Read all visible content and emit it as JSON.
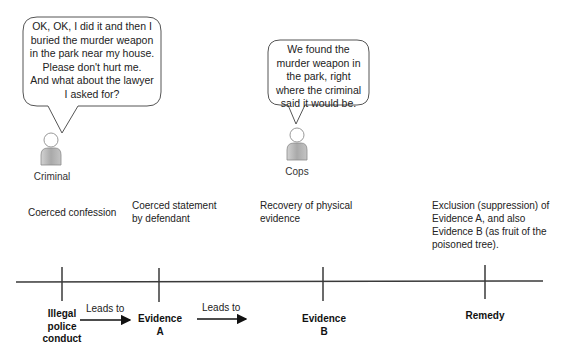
{
  "speech_bubbles": [
    {
      "speaker": "Criminal",
      "lines": [
        "OK, OK, I did it and then I",
        "buried the murder weapon",
        "in the park near my house.",
        "Please don't hurt me.",
        "And what about the lawyer",
        "I asked for?"
      ]
    },
    {
      "speaker": "Cops",
      "lines": [
        "We found the",
        "murder weapon in",
        "the park, right",
        "where the criminal",
        "said it would be."
      ]
    }
  ],
  "persons": [
    {
      "label": "Criminal",
      "icon": "person-icon"
    },
    {
      "label": "Cops",
      "icon": "person-icon"
    }
  ],
  "step_descriptions": [
    {
      "lines": [
        "Coerced confession"
      ]
    },
    {
      "lines": [
        "Coerced statement",
        "by defendant"
      ]
    },
    {
      "lines": [
        "Recovery of physical",
        "evidence"
      ]
    },
    {
      "lines": [
        "Exclusion (suppression) of",
        "Evidence A, and also",
        "Evidence B (as fruit of the",
        "poisoned tree)."
      ]
    }
  ],
  "timeline": {
    "nodes": [
      {
        "lines": [
          "Illegal",
          "police",
          "conduct"
        ]
      },
      {
        "lines": [
          "Evidence",
          "A"
        ]
      },
      {
        "lines": [
          "Evidence",
          "B"
        ]
      },
      {
        "lines": [
          "Remedy"
        ]
      }
    ],
    "edges": [
      {
        "label": "Leads to"
      },
      {
        "label": "Leads to"
      }
    ]
  },
  "colors": {
    "line": "#3a3a3a",
    "bubble_border": "#555555",
    "person_fill": "#b8b8b8",
    "person_stroke": "#8a8a8a"
  }
}
